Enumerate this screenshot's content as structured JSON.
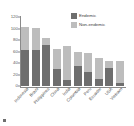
{
  "chart_data": {
    "type": "bar",
    "subtype": "stacked-vertical",
    "title": "",
    "xlabel": "",
    "ylabel": "",
    "ylim": [
      0,
      120
    ],
    "yticks": [
      0,
      20,
      40,
      60,
      80,
      100,
      120
    ],
    "grid": false,
    "legend_position": "top-right",
    "categories": [
      "Indonesia",
      "Brazil",
      "Philippines",
      "China",
      "India",
      "Colombia",
      "Peru",
      "Ecuador",
      "USA",
      "Vietnam"
    ],
    "series": [
      {
        "name": "Endemic",
        "color": "#6e6e6e",
        "values": [
          62,
          63,
          72,
          29,
          11,
          35,
          24,
          12,
          31,
          5
        ]
      },
      {
        "name": "Non-endemic",
        "color": "#bdbdbd",
        "values": [
          40,
          38,
          12,
          35,
          58,
          25,
          34,
          36,
          13,
          39
        ]
      }
    ],
    "totals": [
      102,
      101,
      84,
      64,
      69,
      60,
      58,
      48,
      44,
      44
    ]
  },
  "legend": {
    "items": [
      {
        "label": "Endemic",
        "swatch": "legend-swatch-endemic"
      },
      {
        "label": "Non-endemic",
        "swatch": "legend-swatch-nonendemic"
      }
    ]
  },
  "axis": {
    "y_tick_labels": [
      "120",
      "100",
      "80",
      "60",
      "40",
      "20",
      "0"
    ]
  }
}
